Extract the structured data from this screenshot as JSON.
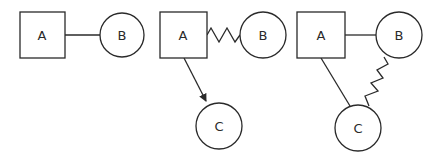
{
  "colors": {
    "stroke": "#2a2a2a",
    "background": "#ffffff"
  },
  "diagrams": [
    {
      "nodes": [
        {
          "id": "A",
          "shape": "square",
          "label": "A"
        },
        {
          "id": "B",
          "shape": "circle",
          "label": "B"
        }
      ],
      "edges": [
        {
          "from": "A",
          "to": "B",
          "style": "straight-line"
        }
      ]
    },
    {
      "nodes": [
        {
          "id": "A",
          "shape": "square",
          "label": "A"
        },
        {
          "id": "B",
          "shape": "circle",
          "label": "B"
        },
        {
          "id": "C",
          "shape": "circle",
          "label": "C"
        }
      ],
      "edges": [
        {
          "from": "A",
          "to": "B",
          "style": "zigzag"
        },
        {
          "from": "A",
          "to": "C",
          "style": "arrow"
        }
      ]
    },
    {
      "nodes": [
        {
          "id": "A",
          "shape": "square",
          "label": "A"
        },
        {
          "id": "B",
          "shape": "circle",
          "label": "B"
        },
        {
          "id": "C",
          "shape": "circle",
          "label": "C"
        }
      ],
      "edges": [
        {
          "from": "A",
          "to": "B",
          "style": "straight-line"
        },
        {
          "from": "A",
          "to": "C",
          "style": "straight-line"
        },
        {
          "from": "B",
          "to": "C",
          "style": "zigzag"
        }
      ]
    }
  ]
}
